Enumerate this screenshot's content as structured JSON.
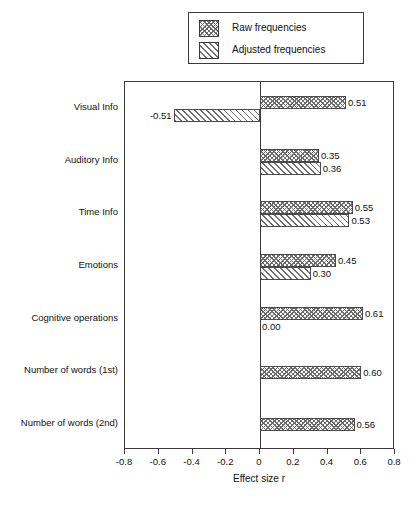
{
  "chart_data": {
    "type": "bar",
    "orientation": "horizontal",
    "title": "",
    "xlabel": "Effect size r",
    "ylabel": "",
    "xlim": [
      -0.8,
      0.8
    ],
    "xticks": [
      -0.8,
      -0.6,
      -0.4,
      -0.2,
      0,
      0.2,
      0.4,
      0.6,
      0.8
    ],
    "xtick_labels": [
      "-0.8",
      "-0.6",
      "-0.4",
      "-0.2",
      "0",
      "0.2",
      "0.4",
      "0.6",
      "0.8"
    ],
    "grid": false,
    "legend_position": "top-right",
    "categories": [
      "Visual Info",
      "Auditory Info",
      "Time Info",
      "Emotions",
      "Cognitive operations",
      "Number of words (1st)",
      "Number of words (2nd)"
    ],
    "series": [
      {
        "name": "Raw frequencies",
        "pattern": "cross-hatch",
        "values": [
          0.51,
          0.35,
          0.55,
          0.45,
          0.61,
          0.6,
          0.56
        ],
        "labels": [
          "0.51",
          "0.35",
          "0.55",
          "0.45",
          "0.61",
          "0.60",
          "0.56"
        ]
      },
      {
        "name": "Adjusted frequencies",
        "pattern": "diagonal-hatch",
        "values": [
          -0.51,
          0.36,
          0.53,
          0.3,
          0.0,
          null,
          null
        ],
        "labels": [
          "-0.51",
          "0.36",
          "0.53",
          "0.30",
          "0.00",
          "",
          ""
        ]
      }
    ]
  },
  "legend": {
    "items": [
      {
        "label": "Raw frequencies",
        "pattern": "cross-hatch"
      },
      {
        "label": "Adjusted frequencies",
        "pattern": "diagonal-hatch"
      }
    ]
  },
  "axis": {
    "x_title": "Effect size r"
  }
}
